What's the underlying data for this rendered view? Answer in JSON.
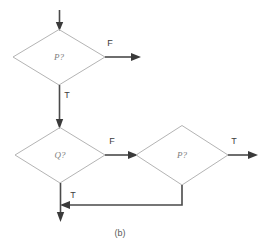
{
  "figure": {
    "caption": "(b)",
    "colors": {
      "background": "#ffffff",
      "diamond_stroke": "#b4b4b4",
      "flow_line": "#4a4a4a",
      "arrow_head": "#3a3a3a",
      "node_text": "#7d7d7d",
      "edge_text": "#3c3c3c",
      "caption_text": "#5a5a5a"
    }
  },
  "nodes": [
    {
      "id": "decision-p-top",
      "label": "P?",
      "cx": 59,
      "cy": 57,
      "rx": 46,
      "ry": 28
    },
    {
      "id": "decision-q",
      "label": "Q?",
      "cx": 60,
      "cy": 155,
      "rx": 45,
      "ry": 28
    },
    {
      "id": "decision-p-right",
      "label": "P?",
      "cx": 182,
      "cy": 155,
      "rx": 46,
      "ry": 30
    }
  ],
  "edges": [
    {
      "id": "entry-arrow",
      "label": "",
      "from": "start",
      "to": "decision-p-top"
    },
    {
      "id": "p-top-false",
      "label": "F",
      "from": "decision-p-top",
      "to": "exit-right-top"
    },
    {
      "id": "p-top-true",
      "label": "T",
      "from": "decision-p-top",
      "to": "decision-q"
    },
    {
      "id": "q-false",
      "label": "F",
      "from": "decision-q",
      "to": "decision-p-right"
    },
    {
      "id": "p-right-true",
      "label": "T",
      "from": "decision-p-right",
      "to": "exit-right-bottom"
    },
    {
      "id": "q-true",
      "label": "T",
      "from": "decision-q",
      "to": "exit-bottom"
    },
    {
      "id": "p-right-false-feedback",
      "label": "",
      "from": "decision-p-right",
      "to": "exit-bottom"
    }
  ],
  "edge_labels": {
    "p_top_false": "F",
    "p_top_true": "T",
    "q_false": "F",
    "p_right_true": "T",
    "q_true": "T"
  }
}
